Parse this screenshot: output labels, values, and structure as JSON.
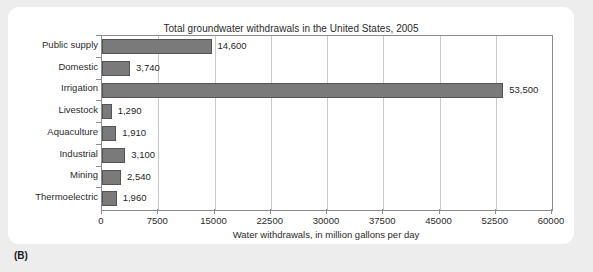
{
  "panel_label": "(B)",
  "chart_data": {
    "type": "bar",
    "orientation": "horizontal",
    "title": "Total groundwater withdrawals in the United States, 2005",
    "xlabel": "Water withdrawals, in million gallons per day",
    "ylabel": "",
    "xlim": [
      0,
      60000
    ],
    "xticks": [
      0,
      7500,
      15000,
      22500,
      30000,
      37500,
      45000,
      52500,
      60000
    ],
    "xtick_labels": [
      "0",
      "7500",
      "15000",
      "22500",
      "30000",
      "37500",
      "45000",
      "52500",
      "60000"
    ],
    "grid": "vertical",
    "legend": null,
    "bar_color": "#7a7a7a",
    "bar_edge_color": "#545454",
    "categories": [
      "Public supply",
      "Domestic",
      "Irrigation",
      "Livestock",
      "Aquaculture",
      "Industrial",
      "Mining",
      "Thermoelectric"
    ],
    "values": [
      14600,
      3740,
      53500,
      1290,
      1910,
      3100,
      2540,
      1960
    ],
    "data_labels": [
      "14,600",
      "3,740",
      "53,500",
      "1,290",
      "1,910",
      "3,100",
      "2,540",
      "1,960"
    ]
  }
}
